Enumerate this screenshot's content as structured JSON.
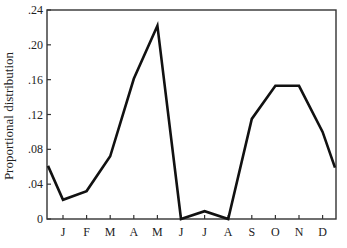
{
  "chart_data": {
    "type": "line",
    "title": "",
    "xlabel": "",
    "ylabel": "Proportional distribution",
    "categories": [
      "J",
      "F",
      "M",
      "A",
      "M",
      "J",
      "J",
      "A",
      "S",
      "O",
      "N",
      "D"
    ],
    "start_value": 0.061,
    "end_value": 0.059,
    "series": [
      {
        "name": "Proportional distribution",
        "values": [
          0.022,
          0.032,
          0.072,
          0.161,
          0.222,
          0.0,
          0.009,
          0.0,
          0.115,
          0.153,
          0.153,
          0.1
        ]
      }
    ],
    "ylim": [
      0,
      0.24
    ],
    "yticks": [
      0,
      0.04,
      0.08,
      0.12,
      0.16,
      0.2,
      0.24
    ],
    "ytick_labels": [
      "0",
      ".04",
      ".08",
      ".12",
      ".16",
      ".20",
      ".24"
    ],
    "grid": false,
    "legend": null,
    "colors": {
      "line": "#111111",
      "axis": "#333333"
    }
  }
}
